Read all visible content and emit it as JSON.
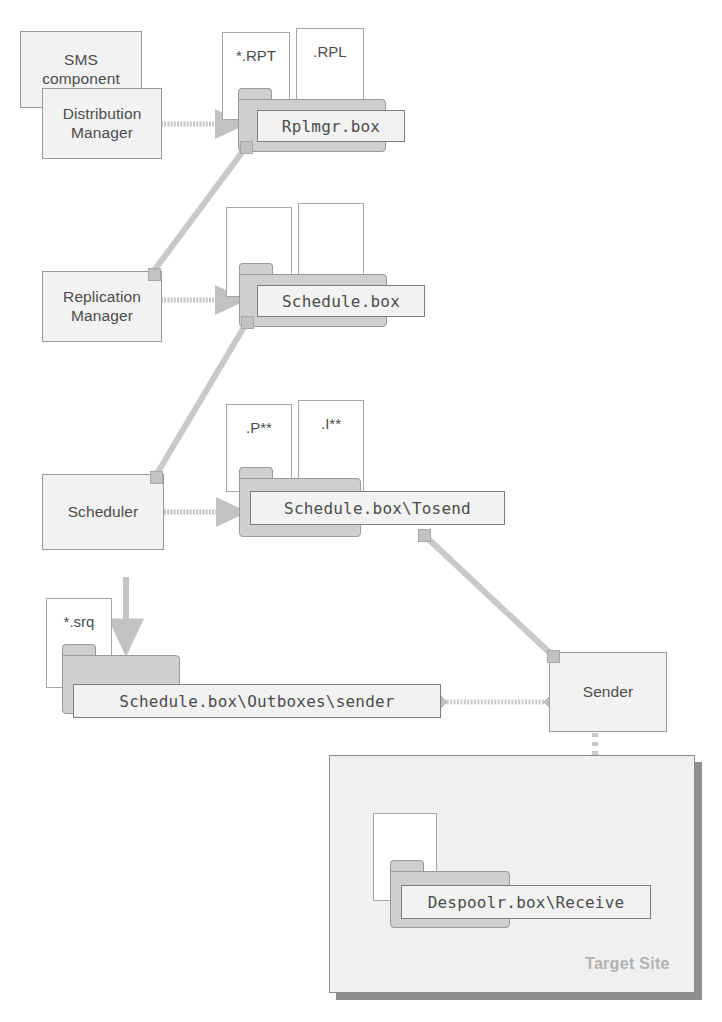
{
  "diagram": {
    "colors": {
      "folder_fill": "#cfcfcf",
      "box_fill": "#f2f2f2",
      "stroke": "#9a9a9a",
      "text": "#4c4c4c",
      "connector": "#c4c4c4",
      "site_fill": "#f0f0f0",
      "site_label": "#b2b2b2",
      "site_shadow": "#8e8e8e"
    },
    "components": [
      {
        "id": "sms-component",
        "label": "SMS\ncomponent"
      },
      {
        "id": "distribution-manager",
        "label": "Distribution\nManager"
      },
      {
        "id": "replication-manager",
        "label": "Replication\nManager"
      },
      {
        "id": "scheduler",
        "label": "Scheduler"
      },
      {
        "id": "sender",
        "label": "Sender"
      }
    ],
    "documents": [
      {
        "id": "doc-rpt",
        "label": "*.RPT"
      },
      {
        "id": "doc-rpl",
        "label": ".RPL"
      },
      {
        "id": "doc-schedule-a",
        "label": ""
      },
      {
        "id": "doc-schedule-b",
        "label": ""
      },
      {
        "id": "doc-p-star",
        "label": ".P**"
      },
      {
        "id": "doc-i-star",
        "label": ".I**"
      },
      {
        "id": "doc-srq",
        "label": "*.srq"
      },
      {
        "id": "doc-despool",
        "label": ""
      }
    ],
    "folders": [
      {
        "id": "folder-rplmgr",
        "label": "Rplmgr.box"
      },
      {
        "id": "folder-schedule",
        "label": "Schedule.box"
      },
      {
        "id": "folder-tosend",
        "label": "Schedule.box\\Tosend"
      },
      {
        "id": "folder-outbox-sender",
        "label": "Schedule.box\\Outboxes\\sender"
      },
      {
        "id": "folder-despoolr-receive",
        "label": "Despoolr.box\\Receive"
      }
    ],
    "site": {
      "id": "target-site",
      "label": "Target Site"
    },
    "connectors": [
      {
        "from": "distribution-manager",
        "to": "folder-rplmgr",
        "style": "arrow"
      },
      {
        "from": "replication-manager",
        "to": "folder-schedule",
        "style": "arrow"
      },
      {
        "from": "scheduler",
        "to": "folder-tosend",
        "style": "arrow"
      },
      {
        "from": "scheduler",
        "to": "folder-outbox-sender",
        "style": "arrow"
      },
      {
        "from": "folder-rplmgr",
        "to": "replication-manager",
        "style": "line"
      },
      {
        "from": "folder-schedule",
        "to": "scheduler",
        "style": "line"
      },
      {
        "from": "folder-tosend",
        "to": "sender",
        "style": "line"
      },
      {
        "from": "folder-outbox-sender",
        "to": "sender",
        "style": "dotted-diamond"
      },
      {
        "from": "sender",
        "to": "folder-despoolr-receive",
        "style": "dotted-arrow"
      }
    ]
  }
}
